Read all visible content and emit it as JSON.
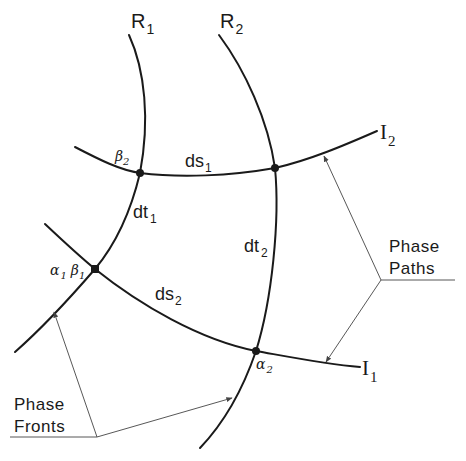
{
  "diagram": {
    "curves": {
      "R1": {
        "label": "R",
        "sub": "1"
      },
      "R2": {
        "label": "R",
        "sub": "2"
      },
      "I1": {
        "label": "I",
        "sub": "1"
      },
      "I2": {
        "label": "I",
        "sub": "2"
      }
    },
    "points": {
      "alpha1_beta1": {
        "a": "α",
        "a_sub": "1",
        "b": "β",
        "b_sub": "1"
      },
      "beta2": {
        "label": "β",
        "sub": "2"
      },
      "alpha2": {
        "label": "α",
        "sub": "2"
      }
    },
    "segments": {
      "ds1": {
        "label": "ds",
        "sub": "1"
      },
      "ds2": {
        "label": "ds",
        "sub": "2"
      },
      "dt1": {
        "label": "dt",
        "sub": "1"
      },
      "dt2": {
        "label": "dt",
        "sub": "2"
      }
    },
    "callouts": {
      "phase_paths": {
        "line1": "Phase",
        "line2": "Paths"
      },
      "phase_fronts": {
        "line1": "Phase",
        "line2": "Fronts"
      }
    },
    "colors": {
      "ink": "#1a1a1a",
      "background": "#ffffff"
    }
  }
}
